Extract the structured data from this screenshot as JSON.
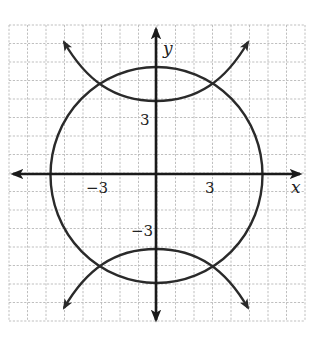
{
  "figure": {
    "type": "coordinate-graph",
    "axes": {
      "x_label": "x",
      "y_label": "y",
      "x_range": [
        -8,
        8
      ],
      "y_range": [
        -8,
        8
      ],
      "grid": true,
      "grid_step": 1
    },
    "tick_labels": {
      "x_neg": "−3",
      "x_pos": "3",
      "y_pos": "3",
      "y_neg": "−3"
    },
    "curves": [
      {
        "name": "circle",
        "equation_estimate": "x^2 + y^2 = 36",
        "center": [
          0,
          0
        ],
        "radius": 6
      },
      {
        "name": "hyperbola",
        "equation_estimate": "y^2 - x^2 = 16",
        "vertices": [
          [
            0,
            4
          ],
          [
            0,
            -4
          ]
        ],
        "opens": "up-down"
      }
    ],
    "intersections_approx": [
      [
        -3.2,
        4.7
      ],
      [
        3.2,
        4.7
      ],
      [
        -3.2,
        -4.7
      ],
      [
        3.2,
        -4.7
      ]
    ],
    "colors": {
      "curve": "#2a2a2a",
      "axis": "#1a1a1a",
      "grid": "#b8b8b8",
      "background": "#ffffff"
    }
  }
}
